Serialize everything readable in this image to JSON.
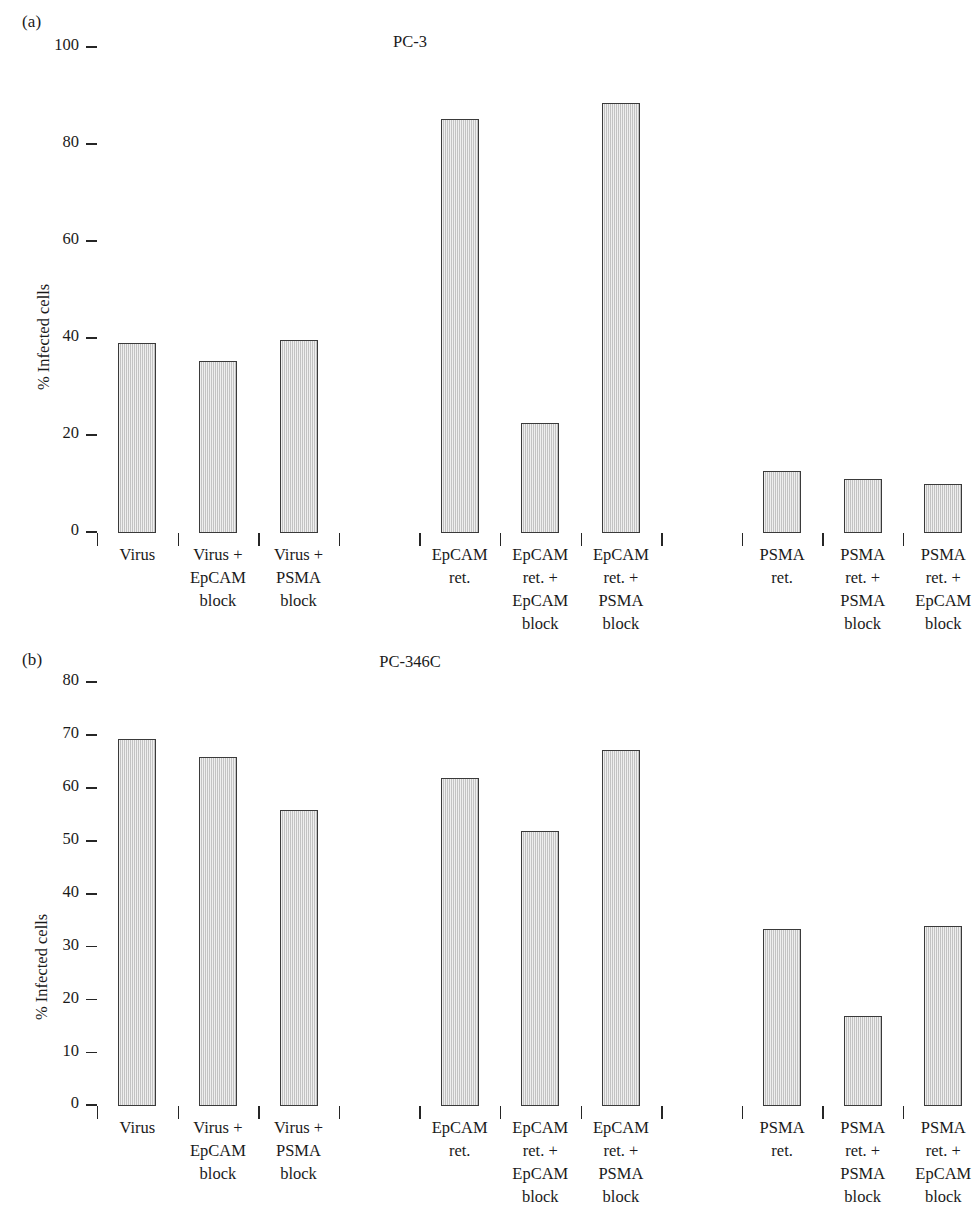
{
  "figure": {
    "width": 920,
    "height": 1226,
    "bar_fill_color": "#d6d6d6",
    "bar_border_color": "#3a3a3a",
    "axis_color": "#262626"
  },
  "panels": [
    {
      "tag": "(a)",
      "title": "PC-3",
      "ylabel": "% Infected cells",
      "yticks": [
        "0",
        "20",
        "40",
        "60",
        "80",
        "100"
      ]
    },
    {
      "tag": "(b)",
      "title": "PC-346C",
      "ylabel": "% Infected cells",
      "yticks": [
        "0",
        "10",
        "20",
        "30",
        "40",
        "50",
        "60",
        "70",
        "80"
      ]
    }
  ],
  "chart_data": [
    {
      "type": "bar",
      "title": "PC-3",
      "panel": "(a)",
      "xlabel": "",
      "ylabel": "% Infected cells",
      "ylim": [
        0,
        100
      ],
      "yticks": [
        0,
        20,
        40,
        60,
        80,
        100
      ],
      "grid": false,
      "legend": "none",
      "categories": [
        "Virus",
        "Virus +\nEpCAM\nblock",
        "Virus +\nPSMA\nblock",
        "EpCAM\nret.",
        "EpCAM\nret. +\nEpCAM\nblock",
        "EpCAM\nret. +\nPSMA\nblock",
        "PSMA\nret.",
        "PSMA\nret. +\nPSMA\nblock",
        "PSMA\nret. +\nEpCAM\nblock"
      ],
      "values": [
        39.2,
        35.5,
        39.8,
        85.3,
        22.6,
        88.6,
        12.8,
        11.2,
        10.2
      ],
      "groups": [
        {
          "name": "Virus",
          "indices": [
            0,
            1,
            2
          ]
        },
        {
          "name": "EpCAM retargeted",
          "indices": [
            3,
            4,
            5
          ]
        },
        {
          "name": "PSMA retargeted",
          "indices": [
            6,
            7,
            8
          ]
        }
      ]
    },
    {
      "type": "bar",
      "title": "PC-346C",
      "panel": "(b)",
      "xlabel": "",
      "ylabel": "% Infected cells",
      "ylim": [
        0,
        80
      ],
      "yticks": [
        0,
        10,
        20,
        30,
        40,
        50,
        60,
        70,
        80
      ],
      "grid": false,
      "legend": "none",
      "categories": [
        "Virus",
        "Virus +\nEpCAM\nblock",
        "Virus +\nPSMA\nblock",
        "EpCAM\nret.",
        "EpCAM\nret. +\nEpCAM\nblock",
        "EpCAM\nret. +\nPSMA\nblock",
        "PSMA\nret.",
        "PSMA\nret. +\nPSMA\nblock",
        "PSMA\nret. +\nEpCAM\nblock"
      ],
      "values": [
        69.5,
        66.0,
        56.0,
        62.0,
        52.0,
        67.3,
        33.4,
        17.1,
        34.0
      ],
      "groups": [
        {
          "name": "Virus",
          "indices": [
            0,
            1,
            2
          ]
        },
        {
          "name": "EpCAM retargeted",
          "indices": [
            3,
            4,
            5
          ]
        },
        {
          "name": "PSMA retargeted",
          "indices": [
            6,
            7,
            8
          ]
        }
      ]
    }
  ],
  "layout": {
    "slot_width": 80.6,
    "bar_width": 38,
    "slots_per_panel": 10,
    "bar_slot_indices": [
      0,
      1,
      2,
      4,
      5,
      6,
      8,
      9,
      10
    ],
    "sep_slot_indices": [
      0,
      1,
      2,
      3,
      4,
      5,
      6,
      7,
      8,
      9,
      10
    ]
  }
}
